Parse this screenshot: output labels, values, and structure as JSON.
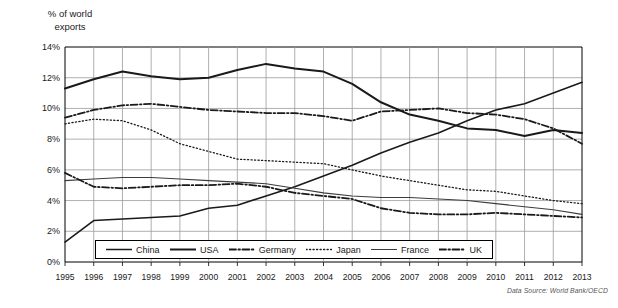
{
  "chart_data": {
    "type": "line",
    "title": "% of world\nexports",
    "xlabel": "",
    "ylabel": "% of world exports",
    "source": "Data Source: World Bank/OECD",
    "grid": true,
    "legend_position": "bottom-inside",
    "ylim": [
      0,
      14
    ],
    "ytick_labels": [
      "0%",
      "2%",
      "4%",
      "6%",
      "8%",
      "10%",
      "12%",
      "14%"
    ],
    "ytick_values": [
      0,
      2,
      4,
      6,
      8,
      10,
      12,
      14
    ],
    "x": [
      1995,
      1996,
      1997,
      1998,
      1999,
      2000,
      2001,
      2002,
      2003,
      2004,
      2005,
      2006,
      2007,
      2008,
      2009,
      2010,
      2011,
      2012,
      2013
    ],
    "xtick_labels": [
      "1995",
      "1996",
      "1997",
      "1998",
      "1999",
      "2000",
      "2001",
      "2002",
      "2003",
      "2004",
      "2005",
      "2006",
      "2007",
      "2008",
      "2009",
      "2010",
      "2011",
      "2012",
      "2013"
    ],
    "series": [
      {
        "name": "China",
        "style": "solid",
        "width": 1.6,
        "color": "#1a1a1a",
        "values": [
          1.3,
          2.7,
          2.8,
          2.9,
          3.0,
          3.5,
          3.7,
          4.3,
          4.9,
          5.6,
          6.3,
          7.1,
          7.8,
          8.4,
          9.2,
          9.9,
          10.3,
          11.0,
          11.7
        ]
      },
      {
        "name": "USA",
        "style": "solid",
        "width": 2.0,
        "color": "#1a1a1a",
        "values": [
          11.3,
          11.9,
          12.4,
          12.1,
          11.9,
          12.0,
          12.5,
          12.9,
          12.6,
          12.4,
          11.6,
          10.4,
          9.6,
          9.2,
          8.7,
          8.6,
          8.2,
          8.6,
          8.4
        ]
      },
      {
        "name": "Germany",
        "style": "dashdot",
        "width": 1.8,
        "color": "#1a1a1a",
        "values": [
          9.4,
          9.9,
          10.2,
          10.3,
          10.1,
          9.9,
          9.8,
          9.7,
          9.7,
          9.5,
          9.2,
          9.8,
          9.9,
          10.0,
          9.7,
          9.6,
          9.3,
          8.7,
          7.7
        ]
      },
      {
        "name": "Japan",
        "style": "dotted",
        "width": 1.3,
        "color": "#1a1a1a",
        "values": [
          9.0,
          9.3,
          9.2,
          8.6,
          7.7,
          7.2,
          6.7,
          6.6,
          6.5,
          6.4,
          6.0,
          5.6,
          5.3,
          5.0,
          4.7,
          4.6,
          4.3,
          4.0,
          3.8
        ]
      },
      {
        "name": "France",
        "style": "solid",
        "width": 1.1,
        "color": "#3c3c3c",
        "values": [
          5.3,
          5.4,
          5.5,
          5.5,
          5.4,
          5.3,
          5.2,
          5.1,
          4.8,
          4.5,
          4.3,
          4.2,
          4.2,
          4.1,
          4.0,
          3.8,
          3.6,
          3.4,
          3.1
        ]
      },
      {
        "name": "UK",
        "style": "dashdot",
        "width": 1.8,
        "color": "#1a1a1a",
        "values": [
          5.8,
          4.9,
          4.8,
          4.9,
          5.0,
          5.0,
          5.1,
          4.9,
          4.5,
          4.3,
          4.1,
          3.5,
          3.2,
          3.1,
          3.1,
          3.2,
          3.1,
          3.0,
          2.9
        ]
      }
    ]
  }
}
